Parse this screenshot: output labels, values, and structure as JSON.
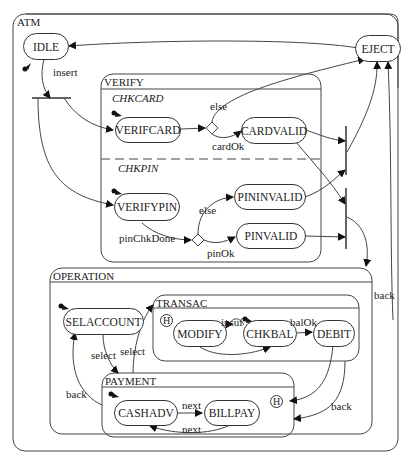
{
  "diagram": {
    "type": "statechart",
    "root": {
      "label": "ATM"
    },
    "composites": {
      "verify": {
        "label": "VERIFY",
        "regions": {
          "chkcard": "CHKCARD",
          "chkpin": "CHKPIN"
        }
      },
      "operation": {
        "label": "OPERATION"
      },
      "transac": {
        "label": "TRANSAC",
        "history": "H"
      },
      "payment": {
        "label": "PAYMENT",
        "history": "H"
      }
    },
    "states": {
      "idle": "IDLE",
      "eject": "EJECT",
      "verifcard": "VERIFCARD",
      "cardvalid": "CARDVALID",
      "verifypin": "VERIFYPIN",
      "pininvalid": "PININVALID",
      "pinvalid": "PINVALID",
      "selaccount": "SELACCOUNT",
      "modify": "MODIFY",
      "chkbal": "CHKBAL",
      "debit": "DEBIT",
      "cashadv": "CASHADV",
      "billpay": "BILLPAY"
    },
    "transitions": {
      "insert": "insert",
      "else_card": "else",
      "card_ok": "cardOk",
      "else_pin": "else",
      "pin_chk_done": "pinChkDone",
      "pin_ok": "pinOk",
      "back_op": "back",
      "select1": "select",
      "select2": "select",
      "insuf": "insuf",
      "bal_ok": "balOk",
      "back_sel": "back",
      "back_pay": "back",
      "next1": "next",
      "next2": "next"
    }
  }
}
